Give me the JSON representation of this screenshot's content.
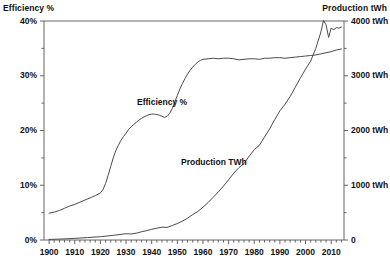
{
  "chart_data": {
    "type": "line",
    "title": "",
    "xlabel": "",
    "grid": false,
    "legend_position": "inline-annotation",
    "x": [
      1900,
      1905,
      1910,
      1915,
      1920,
      1925,
      1930,
      1935,
      1940,
      1945,
      1950,
      1955,
      1960,
      1965,
      1970,
      1975,
      1980,
      1985,
      1990,
      1995,
      2000,
      2005,
      2010,
      2014
    ],
    "axes": {
      "left": {
        "label": "Efficiency %",
        "ticks": [
          "0%",
          "10%",
          "20%",
          "30%",
          "40%"
        ],
        "tick_values": [
          0,
          10,
          20,
          30,
          40
        ],
        "minor_tick_step": 5,
        "lim": [
          0,
          40
        ]
      },
      "right": {
        "label": "Production tWh",
        "ticks": [
          "0",
          "1000 tWh",
          "2000 tWh",
          "3000 tWh",
          "4000 tWh"
        ],
        "tick_values": [
          0,
          1000,
          2000,
          3000,
          4000
        ],
        "minor_tick_step": 500,
        "lim": [
          0,
          4000
        ]
      },
      "bottom": {
        "ticks": [
          "1900",
          "1910",
          "1920",
          "1930",
          "1940",
          "1950",
          "1960",
          "1970",
          "1980",
          "1990",
          "2000",
          "2010"
        ],
        "tick_values": [
          1900,
          1910,
          1920,
          1930,
          1940,
          1950,
          1960,
          1970,
          1980,
          1990,
          2000,
          2010
        ],
        "minor_tick_step": 2,
        "lim": [
          1898,
          2015
        ]
      }
    },
    "series": [
      {
        "name": "Efficiency %",
        "axis": "left",
        "annotation": "Efficiency %",
        "units": "%",
        "color": "#4a4a4a",
        "points": [
          [
            1900,
            4.9
          ],
          [
            1902,
            5.1
          ],
          [
            1904,
            5.4
          ],
          [
            1906,
            5.8
          ],
          [
            1908,
            6.2
          ],
          [
            1910,
            6.5
          ],
          [
            1912,
            6.9
          ],
          [
            1914,
            7.3
          ],
          [
            1916,
            7.7
          ],
          [
            1918,
            8.1
          ],
          [
            1920,
            8.6
          ],
          [
            1921,
            9.2
          ],
          [
            1922,
            10.3
          ],
          [
            1923,
            11.8
          ],
          [
            1924,
            13.4
          ],
          [
            1925,
            15.0
          ],
          [
            1926,
            16.3
          ],
          [
            1927,
            17.3
          ],
          [
            1928,
            18.2
          ],
          [
            1929,
            18.9
          ],
          [
            1930,
            19.5
          ],
          [
            1931,
            20.2
          ],
          [
            1932,
            20.7
          ],
          [
            1933,
            21.1
          ],
          [
            1934,
            21.5
          ],
          [
            1935,
            21.9
          ],
          [
            1936,
            22.2
          ],
          [
            1937,
            22.5
          ],
          [
            1938,
            22.7
          ],
          [
            1939,
            22.9
          ],
          [
            1940,
            23.0
          ],
          [
            1941,
            23.0
          ],
          [
            1942,
            22.9
          ],
          [
            1943,
            22.8
          ],
          [
            1944,
            22.6
          ],
          [
            1945,
            22.4
          ],
          [
            1946,
            22.6
          ],
          [
            1947,
            23.1
          ],
          [
            1948,
            24.0
          ],
          [
            1949,
            25.2
          ],
          [
            1950,
            26.4
          ],
          [
            1951,
            27.6
          ],
          [
            1952,
            28.6
          ],
          [
            1953,
            29.5
          ],
          [
            1954,
            30.3
          ],
          [
            1955,
            31.0
          ],
          [
            1956,
            31.6
          ],
          [
            1957,
            32.1
          ],
          [
            1958,
            32.5
          ],
          [
            1959,
            32.8
          ],
          [
            1960,
            33.0
          ],
          [
            1962,
            33.1
          ],
          [
            1964,
            33.2
          ],
          [
            1966,
            33.1
          ],
          [
            1968,
            33.2
          ],
          [
            1970,
            33.2
          ],
          [
            1972,
            33.1
          ],
          [
            1974,
            32.9
          ],
          [
            1976,
            33.0
          ],
          [
            1978,
            33.1
          ],
          [
            1980,
            33.1
          ],
          [
            1982,
            33.0
          ],
          [
            1984,
            33.2
          ],
          [
            1986,
            33.2
          ],
          [
            1988,
            33.3
          ],
          [
            1990,
            33.3
          ],
          [
            1992,
            33.2
          ],
          [
            1994,
            33.3
          ],
          [
            1996,
            33.4
          ],
          [
            1998,
            33.5
          ],
          [
            2000,
            33.6
          ],
          [
            2002,
            33.7
          ],
          [
            2004,
            33.8
          ],
          [
            2006,
            34.0
          ],
          [
            2008,
            34.2
          ],
          [
            2010,
            34.4
          ],
          [
            2012,
            34.7
          ],
          [
            2014,
            34.9
          ]
        ]
      },
      {
        "name": "Production TWh",
        "axis": "right",
        "annotation": "Production TWh",
        "units": "tWh",
        "color": "#4a4a4a",
        "points": [
          [
            1900,
            10
          ],
          [
            1905,
            18
          ],
          [
            1910,
            30
          ],
          [
            1915,
            45
          ],
          [
            1920,
            60
          ],
          [
            1925,
            85
          ],
          [
            1930,
            115
          ],
          [
            1932,
            110
          ],
          [
            1934,
            125
          ],
          [
            1936,
            150
          ],
          [
            1938,
            170
          ],
          [
            1940,
            195
          ],
          [
            1942,
            215
          ],
          [
            1944,
            235
          ],
          [
            1946,
            230
          ],
          [
            1948,
            265
          ],
          [
            1950,
            300
          ],
          [
            1952,
            345
          ],
          [
            1954,
            400
          ],
          [
            1956,
            465
          ],
          [
            1958,
            520
          ],
          [
            1960,
            600
          ],
          [
            1962,
            685
          ],
          [
            1964,
            780
          ],
          [
            1966,
            880
          ],
          [
            1968,
            985
          ],
          [
            1970,
            1100
          ],
          [
            1972,
            1220
          ],
          [
            1974,
            1320
          ],
          [
            1976,
            1395
          ],
          [
            1978,
            1530
          ],
          [
            1980,
            1650
          ],
          [
            1982,
            1730
          ],
          [
            1984,
            1880
          ],
          [
            1986,
            2030
          ],
          [
            1988,
            2200
          ],
          [
            1990,
            2360
          ],
          [
            1992,
            2480
          ],
          [
            1994,
            2620
          ],
          [
            1996,
            2790
          ],
          [
            1998,
            2960
          ],
          [
            2000,
            3120
          ],
          [
            2002,
            3270
          ],
          [
            2004,
            3500
          ],
          [
            2006,
            3800
          ],
          [
            2007,
            4010
          ],
          [
            2008,
            3930
          ],
          [
            2009,
            3700
          ],
          [
            2010,
            3870
          ],
          [
            2011,
            3840
          ],
          [
            2012,
            3880
          ],
          [
            2013,
            3870
          ],
          [
            2014,
            3890
          ]
        ]
      }
    ]
  }
}
